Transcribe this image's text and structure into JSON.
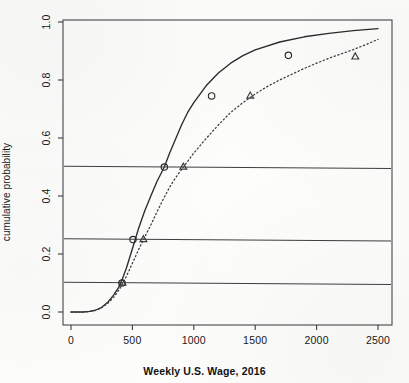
{
  "chart_data": {
    "type": "line",
    "title": "",
    "xlabel": "Weekly U.S. Wage, 2016",
    "ylabel": "cumulative probability",
    "xlim": [
      0,
      2500
    ],
    "ylim": [
      0.0,
      1.0
    ],
    "xticks": [
      0,
      500,
      1000,
      1500,
      2000,
      2500
    ],
    "xtick_labels": [
      "0",
      "500",
      "1000",
      "1500",
      "2000",
      "2500"
    ],
    "yticks": [
      0.0,
      0.2,
      0.4,
      0.6,
      0.8,
      1.0
    ],
    "ytick_labels": [
      "0.0",
      "0.2",
      "0.4",
      "0.6",
      "0.8",
      "1.0"
    ],
    "grid": false,
    "legend": "none",
    "reference_lines": [
      {
        "name": "p10-reference-line",
        "y": 0.1,
        "style": "solid"
      },
      {
        "name": "p25-reference-line",
        "y": 0.25,
        "style": "solid"
      },
      {
        "name": "p50-reference-line",
        "y": 0.5,
        "style": "solid"
      }
    ],
    "series": [
      {
        "name": "solid-cdf-curve",
        "style": "solid",
        "marker": "circle",
        "color": "#2b2b2d",
        "points": [
          {
            "x": 415,
            "y": 0.1
          },
          {
            "x": 505,
            "y": 0.25
          },
          {
            "x": 760,
            "y": 0.5
          },
          {
            "x": 1145,
            "y": 0.745
          },
          {
            "x": 1770,
            "y": 0.885
          }
        ],
        "curve": [
          {
            "x": 0,
            "y": 0.0
          },
          {
            "x": 100,
            "y": 0.0
          },
          {
            "x": 150,
            "y": 0.002
          },
          {
            "x": 200,
            "y": 0.006
          },
          {
            "x": 250,
            "y": 0.016
          },
          {
            "x": 300,
            "y": 0.034
          },
          {
            "x": 350,
            "y": 0.06
          },
          {
            "x": 400,
            "y": 0.093
          },
          {
            "x": 450,
            "y": 0.15
          },
          {
            "x": 500,
            "y": 0.218
          },
          {
            "x": 550,
            "y": 0.288
          },
          {
            "x": 600,
            "y": 0.348
          },
          {
            "x": 650,
            "y": 0.4
          },
          {
            "x": 700,
            "y": 0.45
          },
          {
            "x": 760,
            "y": 0.5
          },
          {
            "x": 800,
            "y": 0.545
          },
          {
            "x": 850,
            "y": 0.595
          },
          {
            "x": 900,
            "y": 0.645
          },
          {
            "x": 950,
            "y": 0.688
          },
          {
            "x": 1000,
            "y": 0.722
          },
          {
            "x": 1100,
            "y": 0.78
          },
          {
            "x": 1200,
            "y": 0.824
          },
          {
            "x": 1300,
            "y": 0.858
          },
          {
            "x": 1400,
            "y": 0.884
          },
          {
            "x": 1500,
            "y": 0.904
          },
          {
            "x": 1700,
            "y": 0.931
          },
          {
            "x": 1900,
            "y": 0.949
          },
          {
            "x": 2100,
            "y": 0.961
          },
          {
            "x": 2300,
            "y": 0.97
          },
          {
            "x": 2500,
            "y": 0.977
          }
        ]
      },
      {
        "name": "dotted-cdf-curve",
        "style": "dotted",
        "marker": "triangle",
        "color": "#3a3a3c",
        "points": [
          {
            "x": 420,
            "y": 0.1
          },
          {
            "x": 590,
            "y": 0.25
          },
          {
            "x": 915,
            "y": 0.5
          },
          {
            "x": 1460,
            "y": 0.745
          },
          {
            "x": 2315,
            "y": 0.88
          }
        ],
        "curve": [
          {
            "x": 0,
            "y": 0.0
          },
          {
            "x": 120,
            "y": 0.0
          },
          {
            "x": 180,
            "y": 0.003
          },
          {
            "x": 240,
            "y": 0.012
          },
          {
            "x": 300,
            "y": 0.03
          },
          {
            "x": 350,
            "y": 0.052
          },
          {
            "x": 400,
            "y": 0.082
          },
          {
            "x": 450,
            "y": 0.122
          },
          {
            "x": 500,
            "y": 0.168
          },
          {
            "x": 550,
            "y": 0.215
          },
          {
            "x": 600,
            "y": 0.258
          },
          {
            "x": 650,
            "y": 0.3
          },
          {
            "x": 700,
            "y": 0.345
          },
          {
            "x": 750,
            "y": 0.388
          },
          {
            "x": 800,
            "y": 0.428
          },
          {
            "x": 850,
            "y": 0.462
          },
          {
            "x": 915,
            "y": 0.5
          },
          {
            "x": 1000,
            "y": 0.548
          },
          {
            "x": 1100,
            "y": 0.598
          },
          {
            "x": 1200,
            "y": 0.645
          },
          {
            "x": 1300,
            "y": 0.688
          },
          {
            "x": 1400,
            "y": 0.722
          },
          {
            "x": 1500,
            "y": 0.752
          },
          {
            "x": 1600,
            "y": 0.778
          },
          {
            "x": 1700,
            "y": 0.8
          },
          {
            "x": 1800,
            "y": 0.82
          },
          {
            "x": 1900,
            "y": 0.84
          },
          {
            "x": 2000,
            "y": 0.858
          },
          {
            "x": 2100,
            "y": 0.875
          },
          {
            "x": 2200,
            "y": 0.89
          },
          {
            "x": 2300,
            "y": 0.905
          },
          {
            "x": 2400,
            "y": 0.922
          },
          {
            "x": 2500,
            "y": 0.94
          }
        ]
      }
    ]
  }
}
